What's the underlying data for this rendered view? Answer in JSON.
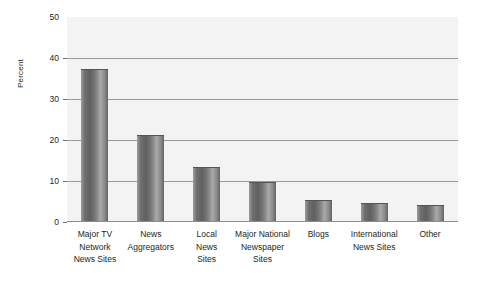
{
  "chart_data": {
    "type": "bar",
    "title": "",
    "xlabel": "",
    "ylabel": "Percent",
    "ylim": [
      0,
      50
    ],
    "yticks": [
      0,
      10,
      20,
      30,
      40,
      50
    ],
    "ytick_labels": [
      "0",
      "10",
      "20",
      "30",
      "40",
      "50"
    ],
    "grid": "horizontal",
    "legend": "none",
    "categories": [
      "Major TV\nNetwork\nNews Sites",
      "News\nAggregators",
      "Local\nNews\nSites",
      "Major National\nNewspaper\nSites",
      "Blogs",
      "International\nNews Sites",
      "Other"
    ],
    "values": [
      37,
      21,
      13.2,
      9.6,
      5.1,
      4.4,
      3.9
    ],
    "colors": {
      "bar_dark": "#5f5f5f",
      "bar_light": "#a9a9a9",
      "plot_background": "#f3f3f3",
      "gridline": "#9a9a9a",
      "text": "#231f20"
    }
  }
}
